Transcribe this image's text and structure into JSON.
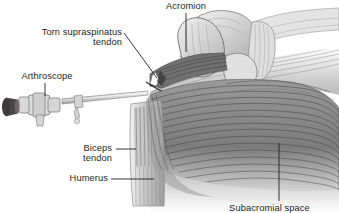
{
  "figure": {
    "style": "grayscale medical line illustration",
    "background_color": "#ffffff",
    "ink_color": "#231f20"
  },
  "labels": {
    "acromion": "Acromion",
    "torn_tendon_line1": "Torn supraspinatus",
    "torn_tendon_line2": "tendon",
    "arthroscope": "Arthroscope",
    "biceps_line1": "Biceps",
    "biceps_line2": "tendon",
    "humerus": "Humerus",
    "subacromial": "Subacromial space"
  },
  "leader_lines": [
    {
      "name": "acromion-leader",
      "from": [
        186,
        14
      ],
      "to": [
        186,
        52
      ],
      "kind": "vertical"
    },
    {
      "name": "torn-tendon-leader",
      "from": [
        124,
        33
      ],
      "to": [
        156,
        77
      ],
      "kind": "diagonal"
    },
    {
      "name": "arthroscope-leader",
      "from": [
        45,
        84
      ],
      "to": [
        45,
        96
      ],
      "kind": "vertical"
    },
    {
      "name": "biceps-leader",
      "from": [
        117,
        150
      ],
      "to": [
        135,
        150
      ],
      "kind": "horizontal"
    },
    {
      "name": "humerus-leader",
      "from": [
        112,
        180
      ],
      "to": [
        153,
        180
      ],
      "kind": "horizontal"
    },
    {
      "name": "subacromial-leader",
      "from": [
        279,
        143
      ],
      "to": [
        279,
        201
      ],
      "kind": "vertical"
    }
  ],
  "anatomy_parts": [
    {
      "name": "acromion-bone",
      "shade": "#d9d9d9"
    },
    {
      "name": "clavicle-bone",
      "shade": "#dcdcdc"
    },
    {
      "name": "coracoacromial-ligament",
      "shade": "#d4d4d4"
    },
    {
      "name": "supraspinatus-tendon-torn",
      "shade": "#6f6f6f"
    },
    {
      "name": "deltoid-muscle",
      "shade": "#8a8a8a"
    },
    {
      "name": "humerus-shaft",
      "shade": "#c8c8c8"
    },
    {
      "name": "biceps-tendon",
      "shade": "#b4b4b4"
    },
    {
      "name": "arthroscope-instrument",
      "shade": "#c9c9c9"
    },
    {
      "name": "arthroscope-eyepiece",
      "shade": "#4a4446"
    }
  ]
}
